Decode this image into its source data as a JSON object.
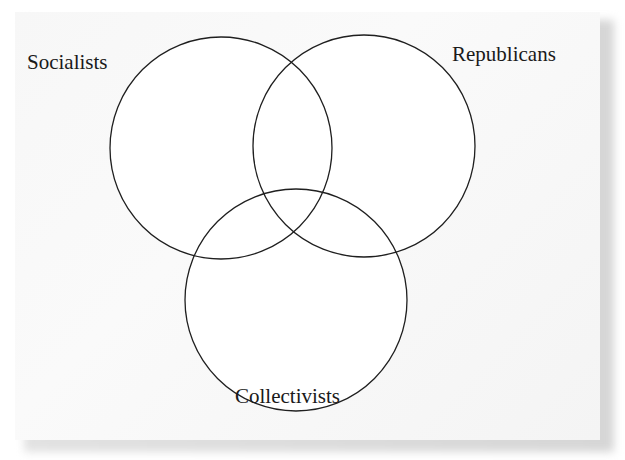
{
  "diagram": {
    "type": "venn",
    "sets": [
      {
        "id": "socialists",
        "label": "Socialists",
        "cx": 221,
        "cy": 148,
        "r": 111
      },
      {
        "id": "republicans",
        "label": "Republicans",
        "cx": 364,
        "cy": 146,
        "r": 111
      },
      {
        "id": "collectivists",
        "label": "Collectivists",
        "cx": 296,
        "cy": 300,
        "r": 111
      }
    ],
    "colors": {
      "stroke": "#1f1f1f",
      "fill": "#ffffff",
      "background": "#f7f7f7"
    }
  }
}
